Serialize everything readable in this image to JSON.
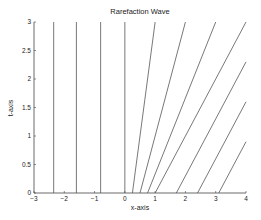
{
  "chart_data": {
    "type": "line",
    "title": "Rarefaction Wave",
    "xlabel": "x-axis",
    "ylabel": "t-axis",
    "xlim": [
      -3,
      4
    ],
    "ylim": [
      0,
      3
    ],
    "xticks": [
      -3,
      -2,
      -1,
      0,
      1,
      2,
      3,
      4
    ],
    "yticks": [
      0,
      0.5,
      1,
      1.5,
      2,
      2.5,
      3
    ],
    "ytick_labels": [
      "0",
      "0.5",
      "1",
      "1.5",
      "2",
      "2.5",
      "3"
    ],
    "grid": false,
    "legend": null,
    "line_color": "#555555",
    "series": [
      {
        "name": "char x0=-2.35",
        "x0": -2.35,
        "speed": 0,
        "points": [
          [
            -2.35,
            0
          ],
          [
            -2.35,
            3
          ]
        ]
      },
      {
        "name": "char x0=-1.6",
        "x0": -1.6,
        "speed": 0,
        "points": [
          [
            -1.6,
            0
          ],
          [
            -1.6,
            3
          ]
        ]
      },
      {
        "name": "char x0=-0.8",
        "x0": -0.8,
        "speed": 0,
        "points": [
          [
            -0.8,
            0
          ],
          [
            -0.8,
            3
          ]
        ]
      },
      {
        "name": "char x0=0",
        "x0": 0,
        "speed": 0,
        "points": [
          [
            0,
            0
          ],
          [
            0,
            3
          ]
        ]
      },
      {
        "name": "char x0=0.25",
        "x0": 0.25,
        "speed": 0.25,
        "points": [
          [
            0.25,
            0
          ],
          [
            1.0,
            3
          ]
        ]
      },
      {
        "name": "char x0=0.5",
        "x0": 0.5,
        "speed": 0.5,
        "points": [
          [
            0.5,
            0
          ],
          [
            2.0,
            3
          ]
        ]
      },
      {
        "name": "char x0=0.75",
        "x0": 0.75,
        "speed": 0.75,
        "points": [
          [
            0.75,
            0
          ],
          [
            3.0,
            3
          ]
        ]
      },
      {
        "name": "char x0=1.0",
        "x0": 1.0,
        "speed": 1,
        "points": [
          [
            1.0,
            0
          ],
          [
            4.0,
            3
          ]
        ]
      },
      {
        "name": "char x0=1.7",
        "x0": 1.7,
        "speed": 1,
        "points": [
          [
            1.7,
            0
          ],
          [
            4.0,
            2.3
          ]
        ]
      },
      {
        "name": "char x0=2.4",
        "x0": 2.4,
        "speed": 1,
        "points": [
          [
            2.4,
            0
          ],
          [
            4.0,
            1.6
          ]
        ]
      },
      {
        "name": "char x0=3.1",
        "x0": 3.1,
        "speed": 1,
        "points": [
          [
            3.1,
            0
          ],
          [
            4.0,
            0.9
          ]
        ]
      }
    ]
  }
}
